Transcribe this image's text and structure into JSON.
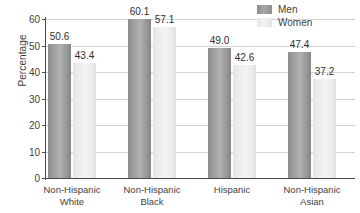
{
  "chart_data": {
    "type": "bar",
    "title": "",
    "xlabel": "",
    "ylabel": "Percentage",
    "ylim": [
      0,
      60
    ],
    "yticks": [
      0,
      10,
      20,
      30,
      40,
      50,
      60
    ],
    "ytick_labels": [
      "0",
      "10",
      "20",
      "30",
      "40",
      "50",
      "60"
    ],
    "grid": true,
    "legend_position": "top-right",
    "categories": [
      "Non-Hispanic White",
      "Non-Hispanic Black",
      "Hispanic",
      "Non-Hispanic Asian"
    ],
    "category_lines": [
      [
        "Non-Hispanic",
        "White"
      ],
      [
        "Non-Hispanic",
        "Black"
      ],
      [
        "Hispanic",
        ""
      ],
      [
        "Non-Hispanic",
        "Asian"
      ]
    ],
    "series": [
      {
        "name": "Men",
        "color": "#a0a0a0",
        "values": [
          50.6,
          60.1,
          49.0,
          47.4
        ],
        "value_labels": [
          "50.6",
          "60.1",
          "49.0",
          "47.4"
        ]
      },
      {
        "name": "Women",
        "color": "#ededed",
        "values": [
          43.4,
          57.1,
          42.6,
          37.2
        ],
        "value_labels": [
          "43.4",
          "57.1",
          "42.6",
          "37.2"
        ]
      }
    ]
  },
  "legend": {
    "items": [
      {
        "label": "Men",
        "swatch": "men-swatch"
      },
      {
        "label": "Women",
        "swatch": "women-swatch"
      }
    ]
  },
  "axes": {
    "y_axis_title": "Percentage"
  }
}
